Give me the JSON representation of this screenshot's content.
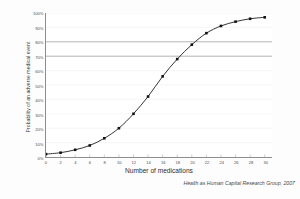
{
  "chart_data": {
    "type": "line",
    "title": "",
    "xlabel": "Number of medications",
    "ylabel": "Probability of an adverse medical event",
    "xlim": [
      0,
      31
    ],
    "ylim": [
      0,
      100
    ],
    "grid": true,
    "legend_position": "none",
    "attribution": "Health as Human Capital Research Group, 2007",
    "marker": "filled-square",
    "line_color": "#1c1c1c",
    "marker_color": "#111111",
    "grid_color": "#ededed",
    "emphasis_grid_color": "#9a9a9a",
    "emphasis_gridlines": [
      70,
      80
    ],
    "yticks": [
      0,
      10,
      20,
      30,
      40,
      50,
      60,
      70,
      80,
      90,
      100
    ],
    "ytick_labels": [
      "0%",
      "10%",
      "20%",
      "30%",
      "40%",
      "50%",
      "60%",
      "70%",
      "80%",
      "90%",
      "100%"
    ],
    "xticks": [
      0,
      2,
      4,
      6,
      8,
      10,
      12,
      14,
      16,
      18,
      20,
      22,
      24,
      26,
      28,
      30
    ],
    "xtick_labels": [
      "0",
      "2",
      "4",
      "6",
      "8",
      "10",
      "12",
      "14",
      "16",
      "18",
      "20",
      "22",
      "24",
      "26",
      "28",
      "30"
    ],
    "x": [
      0,
      2,
      4,
      6,
      8,
      10,
      12,
      14,
      16,
      18,
      20,
      22,
      24,
      26,
      28,
      30
    ],
    "values": [
      2,
      3,
      5,
      8,
      13,
      20,
      30,
      42,
      56,
      68,
      78,
      86,
      91,
      94,
      96,
      97
    ]
  }
}
